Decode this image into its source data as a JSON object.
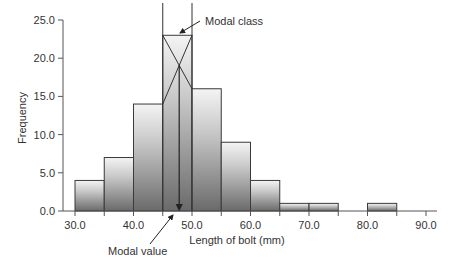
{
  "chart_data": {
    "type": "bar",
    "title": "",
    "xlabel": "Length of bolt (mm)",
    "ylabel": "Frequency",
    "xlim": [
      30,
      90
    ],
    "ylim": [
      0,
      25
    ],
    "x_ticks": [
      "30.0",
      "40.0",
      "50.0",
      "60.0",
      "70.0",
      "80.0",
      "90.0"
    ],
    "y_ticks": [
      "0.0",
      "5.0",
      "10.0",
      "15.0",
      "20.0",
      "25.0"
    ],
    "bin_width": 5,
    "categories": [
      "30-35",
      "35-40",
      "40-45",
      "45-50",
      "50-55",
      "55-60",
      "60-65",
      "65-70",
      "70-75",
      "75-80",
      "80-85"
    ],
    "bins": [
      {
        "from": 30,
        "to": 35,
        "freq": 4
      },
      {
        "from": 35,
        "to": 40,
        "freq": 7
      },
      {
        "from": 40,
        "to": 45,
        "freq": 14
      },
      {
        "from": 45,
        "to": 50,
        "freq": 23
      },
      {
        "from": 50,
        "to": 55,
        "freq": 16
      },
      {
        "from": 55,
        "to": 60,
        "freq": 9
      },
      {
        "from": 60,
        "to": 65,
        "freq": 4
      },
      {
        "from": 65,
        "to": 70,
        "freq": 1
      },
      {
        "from": 70,
        "to": 75,
        "freq": 1
      },
      {
        "from": 75,
        "to": 80,
        "freq": 0
      },
      {
        "from": 80,
        "to": 85,
        "freq": 1
      }
    ],
    "values": [
      4,
      7,
      14,
      23,
      16,
      9,
      4,
      1,
      1,
      0,
      1
    ],
    "annotations": [
      {
        "text": "Modal class",
        "points_to": "top of 45-50 bar"
      },
      {
        "text": "Modal value",
        "x": 47.8
      }
    ],
    "modal_value": 47.8,
    "grid": false,
    "legend": "none"
  },
  "labels": {
    "modal_class": "Modal class",
    "modal_value": "Modal value",
    "xlabel": "Length of bolt (mm)",
    "ylabel": "Frequency"
  },
  "colors": {
    "bar_dark": "#6e6e6e",
    "bar_light": "#f2f2f2",
    "outline": "#3a3a3a"
  }
}
